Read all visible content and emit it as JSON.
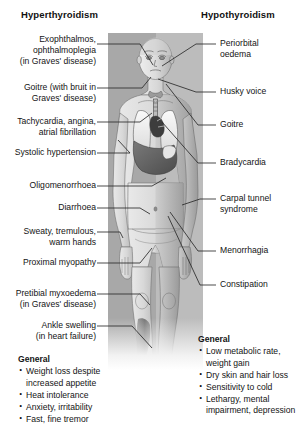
{
  "headers": {
    "left": "Hyperthyroidism",
    "right": "Hypothyroidism"
  },
  "colors": {
    "panel_background": "#b6b6b6",
    "panel_left_shade": "#a8a8a8",
    "panel_right_shade": "#bcbcbc",
    "text": "#141414",
    "leader_line": "#2b2b2b",
    "page_background": "#ffffff"
  },
  "left_labels": [
    {
      "id": "exophthalmos",
      "text": "Exophthalmos,\nophthalmoplegia\n(in Graves' disease)"
    },
    {
      "id": "goitre-bruit",
      "text": "Goitre (with bruit in\nGraves' disease)"
    },
    {
      "id": "tachycardia",
      "text": "Tachycardia, angina,\natrial fibrillation"
    },
    {
      "id": "systolic-hypertension",
      "text": "Systolic hypertension"
    },
    {
      "id": "oligomenorrhoea",
      "text": "Oligomenorrhoea"
    },
    {
      "id": "diarrhoea",
      "text": "Diarrhoea"
    },
    {
      "id": "sweaty-hands",
      "text": "Sweaty, tremulous,\nwarm hands"
    },
    {
      "id": "proximal-myopathy",
      "text": "Proximal myopathy"
    },
    {
      "id": "pretibial-myxoedema",
      "text": "Pretibial myxoedema\n(in Graves' disease)"
    },
    {
      "id": "ankle-swelling",
      "text": "Ankle swelling\n(in heart failure)"
    }
  ],
  "right_labels": [
    {
      "id": "periorbital-oedema",
      "text": "Periorbital\noedema"
    },
    {
      "id": "husky-voice",
      "text": "Husky voice"
    },
    {
      "id": "goitre",
      "text": "Goitre"
    },
    {
      "id": "bradycardia",
      "text": "Bradycardia"
    },
    {
      "id": "carpal-tunnel",
      "text": "Carpal tunnel\nsyndrome"
    },
    {
      "id": "menorrhagia",
      "text": "Menorrhagia"
    },
    {
      "id": "constipation",
      "text": "Constipation"
    }
  ],
  "general_left": {
    "title": "General",
    "items": [
      "Weight loss despite\nincreased appetite",
      "Heat intolerance",
      "Anxiety, irritability",
      "Fast, fine tremor"
    ]
  },
  "general_right": {
    "title": "General",
    "items": [
      "Low metabolic rate,\nweight gain",
      "Dry skin and hair loss",
      "Sensitivity to cold",
      "Lethargy, mental\nimpairment, depression"
    ]
  }
}
